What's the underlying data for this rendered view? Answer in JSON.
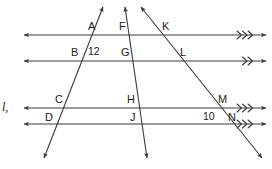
{
  "figure": {
    "kind": "geometry-diagram",
    "background_color": "#ffffff",
    "stroke_color": "#3a3a3a",
    "text_color": "#1b1b1b",
    "line_name": "l,",
    "point_labels": [
      {
        "id": "A",
        "text": "A",
        "x": 88,
        "y": 21
      },
      {
        "id": "F",
        "text": "F",
        "x": 119,
        "y": 21
      },
      {
        "id": "K",
        "text": "K",
        "x": 162,
        "y": 21
      },
      {
        "id": "B",
        "text": "B",
        "x": 71,
        "y": 47
      },
      {
        "id": "G",
        "text": "G",
        "x": 121,
        "y": 47
      },
      {
        "id": "L",
        "text": "L",
        "x": 180,
        "y": 47
      },
      {
        "id": "C",
        "text": "C",
        "x": 55,
        "y": 94
      },
      {
        "id": "H",
        "text": "H",
        "x": 127,
        "y": 94
      },
      {
        "id": "M",
        "text": "M",
        "x": 218,
        "y": 94
      },
      {
        "id": "D",
        "text": "D",
        "x": 45,
        "y": 112
      },
      {
        "id": "J",
        "text": "J",
        "x": 130,
        "y": 112
      },
      {
        "id": "N",
        "text": "N",
        "x": 228,
        "y": 112
      }
    ],
    "measure_labels": [
      {
        "id": "seg-12",
        "text": "12",
        "x": 88,
        "y": 46
      },
      {
        "id": "seg-10",
        "text": "10",
        "x": 203,
        "y": 111
      }
    ],
    "parallel_lines": [
      {
        "id": "line-1",
        "y": 35,
        "x_start": 24,
        "x_end": 266,
        "tick_marks": 3
      },
      {
        "id": "line-2",
        "y": 61,
        "x_start": 24,
        "x_end": 266,
        "tick_marks": 2
      },
      {
        "id": "line-3",
        "y": 108,
        "x_start": 24,
        "x_end": 266,
        "tick_marks": 3
      },
      {
        "id": "line-4",
        "y": 124,
        "x_start": 24,
        "x_end": 266,
        "tick_marks": 3
      }
    ],
    "transversals": [
      {
        "id": "transversal-1",
        "x_top": 103,
        "y_top": 7,
        "x_bottom": 44,
        "y_bottom": 158
      },
      {
        "id": "transversal-2",
        "x_top": 125,
        "y_top": 7,
        "x_bottom": 147,
        "y_bottom": 158
      },
      {
        "id": "transversal-3",
        "x_top": 141,
        "y_top": 7,
        "x_bottom": 262,
        "y_bottom": 158
      }
    ]
  }
}
